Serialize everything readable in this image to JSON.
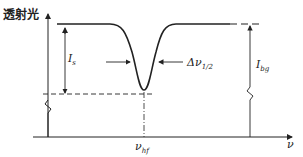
{
  "diagram": {
    "y_axis_label": "透射光",
    "x_axis_label": "ν",
    "labels": {
      "signal_intensity": "I",
      "signal_intensity_sub": "s",
      "background_intensity": "I",
      "background_intensity_sub": "bg",
      "linewidth": "Δν",
      "linewidth_sub": "1/2",
      "hf_frequency": "ν",
      "hf_frequency_sub": "hf"
    },
    "colors": {
      "line": "#222222",
      "background": "#ffffff"
    }
  }
}
